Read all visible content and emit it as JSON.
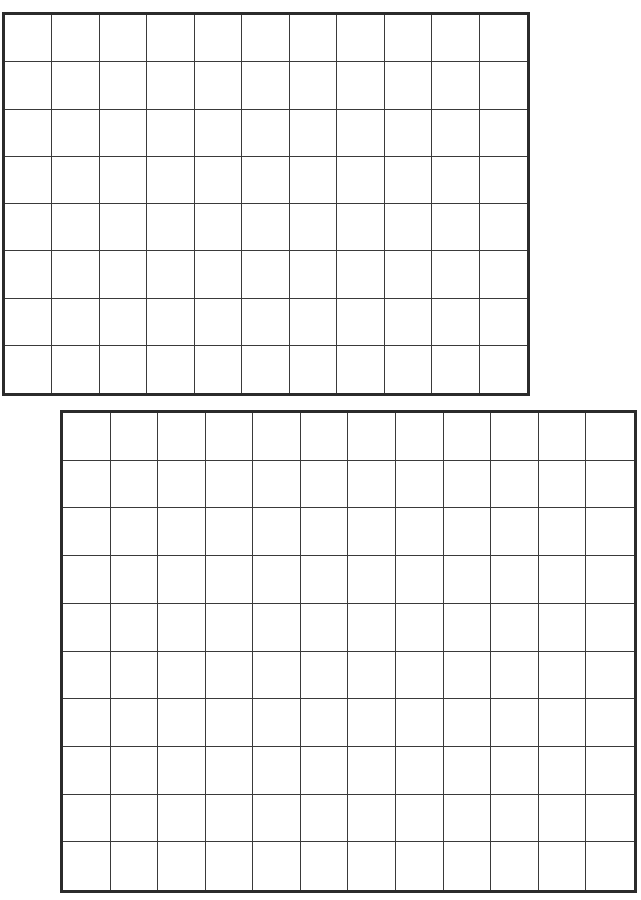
{
  "page": {
    "background": "#ffffff",
    "line_color": "#3a3a3a",
    "border_color": "#2b2b2b"
  },
  "grids": [
    {
      "name": "top-grid",
      "columns": 11,
      "rows": 8,
      "left": 2,
      "top": 12,
      "width": 528,
      "height": 384
    },
    {
      "name": "bottom-grid",
      "columns": 12,
      "rows": 10,
      "left": 60,
      "top": 410,
      "width": 577,
      "height": 483
    }
  ]
}
